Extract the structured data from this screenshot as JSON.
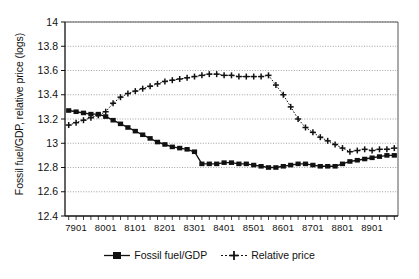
{
  "chart_data": {
    "type": "line",
    "title": "",
    "xlabel": "",
    "ylabel": "Fossil fuel/GDP, relative price (logs)",
    "ylim": [
      12.4,
      14
    ],
    "yticks": [
      12.4,
      12.6,
      12.8,
      13,
      13.2,
      13.4,
      13.6,
      13.8,
      14
    ],
    "ytick_labels": [
      "12.4",
      "12.6",
      "12.8",
      "13",
      "13.2",
      "13.4",
      "13.6",
      "13.8",
      "14"
    ],
    "xtick_labels": [
      "7901",
      "8001",
      "8101",
      "8201",
      "8301",
      "8401",
      "8501",
      "8601",
      "8701",
      "8801",
      "8901"
    ],
    "x": [
      "7804",
      "7901",
      "7902",
      "7903",
      "7904",
      "8001",
      "8002",
      "8003",
      "8004",
      "8101",
      "8102",
      "8103",
      "8104",
      "8201",
      "8202",
      "8203",
      "8204",
      "8301",
      "8302",
      "8303",
      "8304",
      "8401",
      "8402",
      "8403",
      "8404",
      "8501",
      "8502",
      "8503",
      "8504",
      "8601",
      "8602",
      "8603",
      "8604",
      "8701",
      "8702",
      "8703",
      "8704",
      "8801",
      "8802",
      "8803",
      "8804",
      "8901",
      "8902",
      "8903",
      "8904"
    ],
    "grid": true,
    "legend_position": "bottom",
    "series": [
      {
        "name": "Fossil fuel/GDP",
        "marker": "square",
        "line_style": "solid",
        "color": "#111111",
        "values": [
          13.27,
          13.26,
          13.25,
          13.24,
          13.24,
          13.22,
          13.19,
          13.16,
          13.13,
          13.1,
          13.07,
          13.04,
          13.01,
          12.99,
          12.97,
          12.96,
          12.95,
          12.93,
          12.83,
          12.83,
          12.83,
          12.84,
          12.84,
          12.83,
          12.83,
          12.82,
          12.81,
          12.8,
          12.8,
          12.81,
          12.82,
          12.83,
          12.83,
          12.82,
          12.81,
          12.81,
          12.81,
          12.83,
          12.85,
          12.86,
          12.87,
          12.88,
          12.89,
          12.9,
          12.9
        ]
      },
      {
        "name": "Relative price",
        "marker": "plus",
        "line_style": "dotted",
        "color": "#111111",
        "values": [
          13.15,
          13.17,
          13.19,
          13.21,
          13.23,
          13.26,
          13.33,
          13.38,
          13.41,
          13.43,
          13.45,
          13.47,
          13.49,
          13.51,
          13.52,
          13.53,
          13.54,
          13.55,
          13.56,
          13.57,
          13.57,
          13.56,
          13.56,
          13.55,
          13.55,
          13.55,
          13.55,
          13.56,
          13.48,
          13.4,
          13.3,
          13.2,
          13.13,
          13.09,
          13.05,
          13.02,
          12.99,
          12.96,
          12.93,
          12.94,
          12.95,
          12.94,
          12.95,
          12.95,
          12.96
        ]
      }
    ]
  },
  "legend": {
    "items": [
      {
        "label": "Fossil fuel/GDP",
        "marker": "square-marker"
      },
      {
        "label": "Relative price",
        "marker": "plus-marker"
      }
    ]
  }
}
